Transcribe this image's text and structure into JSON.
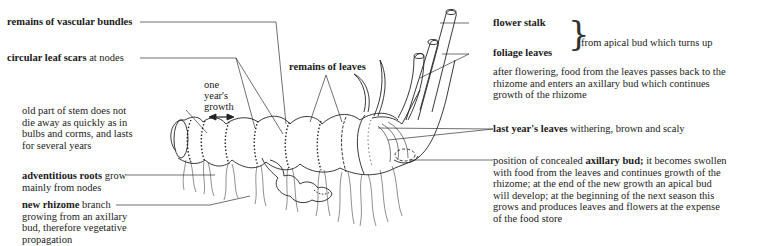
{
  "diagram": {
    "subject": "rhizome",
    "labels": {
      "vascular": {
        "bold": "remains of vascular bundles",
        "rest": ""
      },
      "leaf_scars": {
        "bold": "circular leaf scars",
        "rest": " at nodes"
      },
      "one_year": {
        "line1": "one",
        "line2": "year's",
        "line3": "growth"
      },
      "remains_leaves": {
        "bold": "remains of leaves",
        "rest": ""
      },
      "old_stem": {
        "lines": [
          "old part of stem does not",
          "die away as quickly as in",
          "bulbs and corms, and lasts",
          "for several years"
        ]
      },
      "adv_roots": {
        "bold": "adventitious roots",
        "rest": " grow",
        "line2": "mainly from nodes"
      },
      "new_rhizome": {
        "bold": "new rhizome",
        "rest": " branch",
        "line2": "growing from an axillary",
        "line3": "bud, therefore vegetative",
        "line4": "propagation"
      },
      "flower_stalk": {
        "bold": "flower stalk"
      },
      "foliage_leaves": {
        "bold": "foliage leaves"
      },
      "apical_bud": {
        "text": "from apical bud which turns up"
      },
      "after_flowering": {
        "lines": [
          "after flowering, food from the leaves passes back to the",
          "rhizome and enters an axillary bud which continues",
          "growth of the rhizome"
        ]
      },
      "last_year": {
        "bold": "last year's leaves",
        "rest": " withering, brown and scaly"
      },
      "axillary": {
        "pre": "position of concealed ",
        "bold": "axillary bud;",
        "post": " it becomes swollen",
        "lines": [
          "with food from the leaves and continues growth of the",
          "rhizome; at the end of the new growth an apical bud",
          "will develop; at the beginning of the next season this",
          "grows and produces leaves and flowers at the expense",
          "of the food store"
        ]
      }
    },
    "icons": {
      "brace": "}",
      "double_arrow": "double-headed-arrow"
    }
  }
}
